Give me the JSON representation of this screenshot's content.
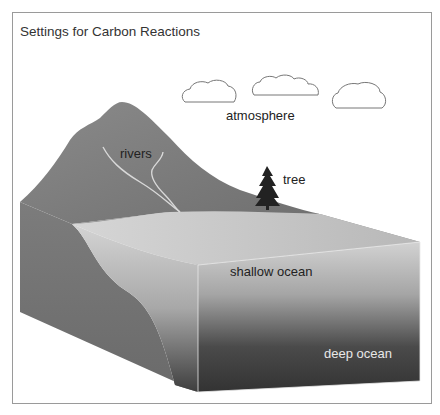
{
  "title": "Settings for Carbon Reactions",
  "labels": {
    "atmosphere": "atmosphere",
    "rivers": "rivers",
    "tree": "tree",
    "shallow_ocean": "shallow ocean",
    "deep_ocean": "deep ocean"
  },
  "colors": {
    "mountain": "#7d7d7d",
    "land_side": "#6e6e6e",
    "shallow": "#c8c8c8",
    "deep": "#3a3a3a",
    "tree": "#222222",
    "river": "#d6d6d6",
    "cloud_stroke": "#777777",
    "frame": "#9a9a9a"
  }
}
